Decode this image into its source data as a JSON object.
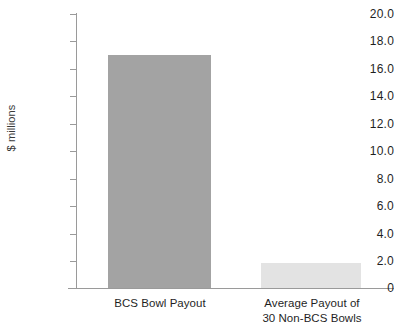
{
  "chart_data": {
    "type": "bar",
    "title": "",
    "xlabel": "",
    "ylabel": "$ millions",
    "categories": [
      "BCS Bowl Payout",
      "Average Payout of 30 Non-BCS Bowls"
    ],
    "category_lines": [
      [
        "BCS Bowl Payout"
      ],
      [
        "Average Payout of",
        "30 Non-BCS Bowls"
      ]
    ],
    "values": [
      17.0,
      1.8
    ],
    "ylim": [
      0,
      20
    ],
    "ytick_interval": 2,
    "ytick_labels": [
      "20.0",
      "18.0",
      "16.0",
      "14.0",
      "12.0",
      "10.0",
      "8.0",
      "6.0",
      "4.0",
      "2.0",
      "0"
    ],
    "ytick_values": [
      20,
      18,
      16,
      14,
      12,
      10,
      8,
      6,
      4,
      2,
      0
    ],
    "grid": false,
    "legend": false,
    "bar_colors": [
      "#a3a3a3",
      "#e3e3e3"
    ],
    "axis_color": "#9a9a9a",
    "background": "#ffffff"
  },
  "axis": {
    "y_title": "$ millions",
    "t20": "20.0",
    "t18": "18.0",
    "t16": "16.0",
    "t14": "14.0",
    "t12": "12.0",
    "t10": "10.0",
    "t8": "8.0",
    "t6": "6.0",
    "t4": "4.0",
    "t2": "2.0",
    "t0": "0"
  },
  "categories": {
    "bar1_line1": "BCS Bowl Payout",
    "bar2_line1": "Average Payout of",
    "bar2_line2": "30 Non-BCS Bowls"
  }
}
